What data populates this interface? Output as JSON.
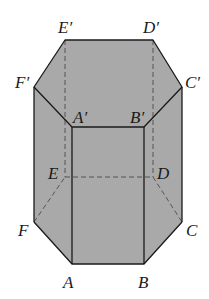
{
  "figure": {
    "type": "hexagonal-prism",
    "fill_color": "#a9a9a9",
    "edge_color": "#1a1a1a",
    "hidden_edge_color": "#555555",
    "vertices": {
      "A": [
        72,
        264
      ],
      "B": [
        144,
        264
      ],
      "C": [
        182,
        222
      ],
      "D": [
        153,
        177
      ],
      "E": [
        65,
        177
      ],
      "F": [
        34,
        222
      ],
      "A'": [
        72,
        127
      ],
      "B'": [
        144,
        127
      ],
      "C'": [
        182,
        87
      ],
      "D'": [
        153,
        40
      ],
      "E'": [
        65,
        40
      ],
      "F'": [
        34,
        87
      ]
    },
    "labels": {
      "A": "A",
      "B": "B",
      "C": "C",
      "D": "D",
      "E": "E",
      "F": "F",
      "A_prime": "A′",
      "B_prime": "B′",
      "C_prime": "C′",
      "D_prime": "D′",
      "E_prime": "E′",
      "F_prime": "F′"
    }
  }
}
